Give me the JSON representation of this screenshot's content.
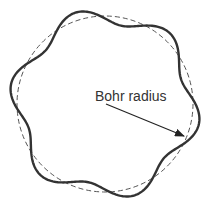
{
  "diagram": {
    "label": "Bohr radius",
    "circle": {
      "cx": 105,
      "cy": 104,
      "r": 88,
      "stroke": "#555555",
      "dash": "5,3"
    },
    "wave": {
      "lobes": 6,
      "amplitude": 8,
      "phase_deg": 12,
      "stroke": "#333333",
      "width": 2.4
    },
    "arrow": {
      "x1": 106,
      "y1": 104,
      "x2": 184,
      "y2": 136,
      "color": "#222222"
    }
  }
}
